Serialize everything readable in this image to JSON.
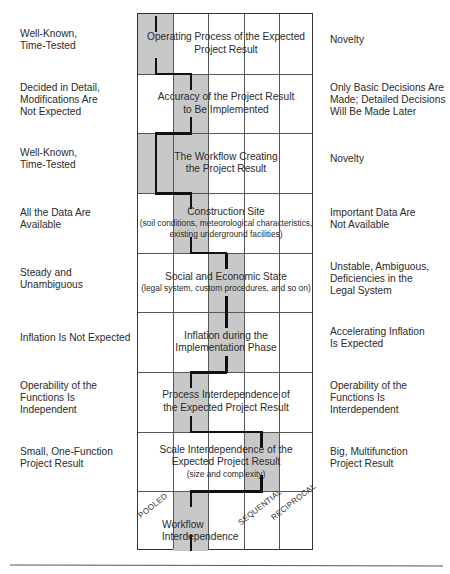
{
  "left_labels": [
    [
      "Well-Known,",
      "Time-Tested"
    ],
    [
      "Decided in Detail,",
      "Modifications Are",
      "Not Expected"
    ],
    [
      "Well-Known,",
      "Time-Tested"
    ],
    [
      "All the Data Are",
      "Available"
    ],
    [
      "Steady and",
      "Unambiguous"
    ],
    [
      "Inflation Is Not Expected"
    ],
    [
      "Operability of the",
      "Functions Is",
      "Independent"
    ],
    [
      "Small, One-Function",
      "Project Result"
    ]
  ],
  "right_labels": [
    [
      "Novelty"
    ],
    [
      "Only Basic Decisions Are",
      "Made; Detailed Decisions",
      "Will Be Made Later"
    ],
    [
      "Novelty"
    ],
    [
      "Important Data Are",
      "Not Available"
    ],
    [
      "Unstable, Ambiguous,",
      "Deficiencies in the",
      "Legal System"
    ],
    [
      "Accelerating Inflation",
      "Is Expected"
    ],
    [
      "Operability of the",
      "Functions Is",
      "Interdependent"
    ],
    [
      "Big, Multifunction",
      "Project Result"
    ]
  ],
  "rows": [
    {
      "title": [
        "Operating Process of the Expected",
        "Project Result"
      ],
      "sub": [],
      "gray_cols": [
        0
      ],
      "line_col": 0
    },
    {
      "title": [
        "Accuracy of the Project Result",
        "to Be Implemented"
      ],
      "sub": [],
      "gray_cols": [
        1
      ],
      "line_col": 1
    },
    {
      "title": [
        "The Workflow Creating",
        "the Project Result"
      ],
      "sub": [],
      "gray_cols": [
        0,
        1
      ],
      "line_col": 0
    },
    {
      "title": [
        "Construction Site"
      ],
      "sub": [
        "(soil conditions, meteorological characteristics,",
        "existing underground facilities)"
      ],
      "gray_cols": [
        1
      ],
      "line_col": 1
    },
    {
      "title": [
        "Social and Economic State"
      ],
      "sub": [
        "(legal system, custom procedures, and so on)"
      ],
      "gray_cols": [
        2
      ],
      "line_col": 2
    },
    {
      "title": [
        "Inflation during the",
        "Implementation Phase"
      ],
      "sub": [],
      "gray_cols": [
        2
      ],
      "line_col": 2
    },
    {
      "title": [
        "Process Interdependence of",
        "the Expected Project Result"
      ],
      "sub": [],
      "gray_cols": [
        1
      ],
      "line_col": 1
    },
    {
      "title": [
        "Scale Interdependence of the",
        "Expected Project Result"
      ],
      "sub": [
        "(size and complexity)"
      ],
      "gray_cols": [
        3
      ],
      "line_col": 3
    },
    {
      "title": [
        "Workflow",
        "Interdependence"
      ],
      "sub": [],
      "gray_cols": [
        1
      ],
      "line_col": 1
    }
  ],
  "bottom_row_labels": {
    "pooled": "POOLED",
    "sequential": "SEQUENTIAL",
    "reciprocal": "RECIPROCAL"
  },
  "grid": {
    "columns": 5,
    "rows": 9
  },
  "colors": {
    "gray_fill": "#c8c8c8",
    "path": "#111111",
    "grid_line": "#555555"
  }
}
